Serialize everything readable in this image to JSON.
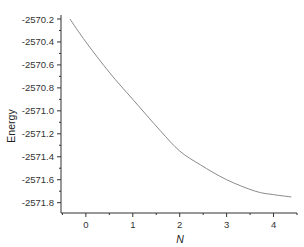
{
  "chart_data": {
    "type": "line",
    "title": "",
    "xlabel": "N",
    "ylabel": "Energy",
    "xlim": [
      -0.53,
      4.5
    ],
    "ylim": [
      -2571.89,
      -2570.2
    ],
    "grid": false,
    "legend": "none",
    "x_ticks": [
      0,
      1,
      2,
      3,
      4
    ],
    "x_tick_labels": [
      "0",
      "1",
      "2",
      "3",
      "4"
    ],
    "y_ticks": [
      -2570.2,
      -2570.4,
      -2570.6,
      -2570.8,
      -2571.0,
      -2571.2,
      -2571.4,
      -2571.6,
      -2571.8
    ],
    "y_tick_labels": [
      "-2570.2",
      "-2570.4",
      "-2570.6",
      "-2570.8",
      "-2571.0",
      "-2571.2",
      "-2571.4",
      "-2571.6",
      "-2571.8"
    ],
    "series": [
      {
        "name": "Energy",
        "color": "#8a8a8a",
        "x": [
          -0.34,
          0.0,
          0.51,
          1.0,
          1.58,
          2.0,
          2.44,
          3.0,
          3.61,
          4.0,
          4.38
        ],
        "y": [
          -2570.2,
          -2570.4,
          -2570.67,
          -2570.9,
          -2571.17,
          -2571.35,
          -2571.47,
          -2571.6,
          -2571.7,
          -2571.73,
          -2571.75
        ]
      }
    ]
  }
}
